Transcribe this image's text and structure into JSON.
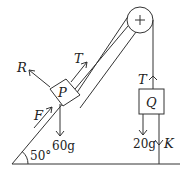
{
  "diagram": {
    "type": "mechanics-free-body",
    "incline_angle_label": "50°",
    "pulley_symbol": "+",
    "block_p": {
      "label": "P",
      "forces": {
        "normal": "R",
        "tension": "T",
        "applied": "F",
        "weight": "60g"
      }
    },
    "block_q": {
      "label": "Q",
      "forces": {
        "tension": "T",
        "weight": "20g",
        "string_below": "K"
      }
    }
  }
}
